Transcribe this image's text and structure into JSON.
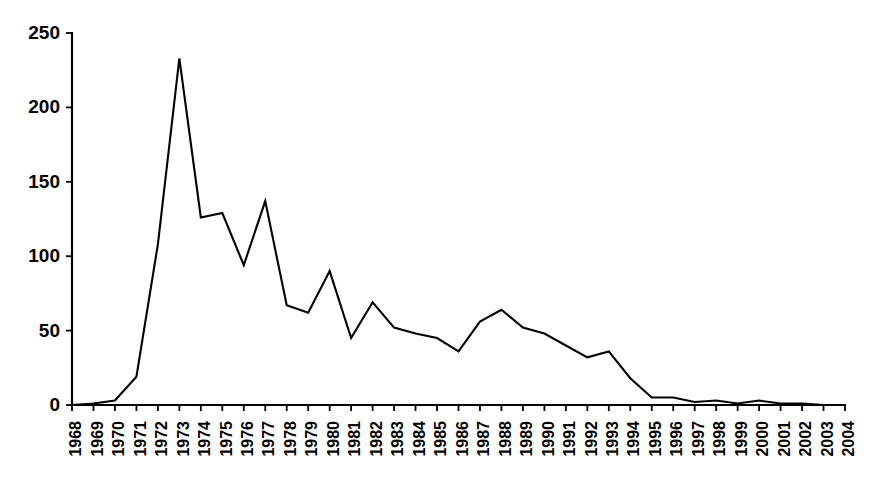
{
  "chart_data": {
    "type": "line",
    "title": "",
    "subtitle": "",
    "xlabel": "",
    "ylabel": "",
    "xlim": [
      1968,
      2004
    ],
    "ylim": [
      0,
      250
    ],
    "grid": false,
    "legend": false,
    "legend_position": "none",
    "yticks": [
      0,
      50,
      100,
      150,
      200,
      250
    ],
    "ytick_labels": [
      "0",
      "50",
      "100",
      "150",
      "200",
      "250"
    ],
    "categories": [
      "1968",
      "1969",
      "1970",
      "1971",
      "1972",
      "1973",
      "1974",
      "1975",
      "1976",
      "1977",
      "1978",
      "1979",
      "1980",
      "1981",
      "1982",
      "1983",
      "1984",
      "1985",
      "1986",
      "1987",
      "1988",
      "1989",
      "1990",
      "1991",
      "1992",
      "1993",
      "1994",
      "1995",
      "1996",
      "1997",
      "1998",
      "1999",
      "2000",
      "2001",
      "2002",
      "2003",
      "2004"
    ],
    "x": [
      1968,
      1969,
      1970,
      1971,
      1972,
      1973,
      1974,
      1975,
      1976,
      1977,
      1978,
      1979,
      1980,
      1981,
      1982,
      1983,
      1984,
      1985,
      1986,
      1987,
      1988,
      1989,
      1990,
      1991,
      1992,
      1993,
      1994,
      1995,
      1996,
      1997,
      1998,
      1999,
      2000,
      2001,
      2002,
      2003,
      2004
    ],
    "values": [
      0,
      1,
      3,
      19,
      108,
      233,
      126,
      129,
      94,
      137,
      67,
      62,
      90,
      45,
      69,
      52,
      48,
      45,
      36,
      56,
      64,
      52,
      48,
      40,
      32,
      36,
      18,
      5,
      5,
      2,
      3,
      1,
      3,
      1,
      1,
      0,
      0
    ],
    "series": [
      {
        "name": "series-1",
        "color": "#000000",
        "values": [
          0,
          1,
          3,
          19,
          108,
          233,
          126,
          129,
          94,
          137,
          67,
          62,
          90,
          45,
          69,
          52,
          48,
          45,
          36,
          56,
          64,
          52,
          48,
          40,
          32,
          36,
          18,
          5,
          5,
          2,
          3,
          1,
          3,
          1,
          1,
          0,
          0
        ]
      }
    ]
  }
}
